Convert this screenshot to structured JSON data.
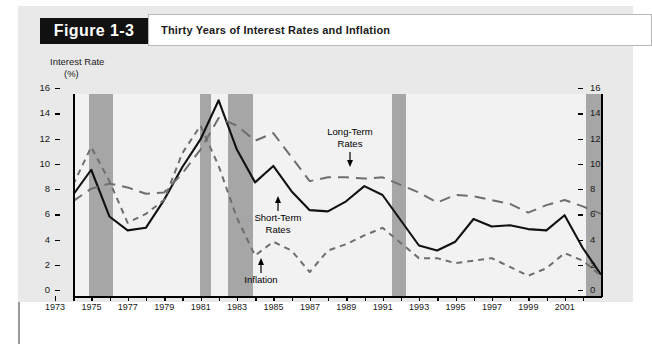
{
  "figure": {
    "badge": "Figure 1-3",
    "title": "Thirty Years of Interest Rates and Inflation"
  },
  "axis": {
    "y_title_line1": "Interest Rate",
    "y_title_line2": "(%)"
  },
  "annotations": {
    "long_term_line1": "Long-Term",
    "long_term_line2": "Rates",
    "short_term_line1": "Short-Term",
    "short_term_line2": "Rates",
    "inflation": "Inflation"
  },
  "colors": {
    "page_background": "#ffffff",
    "figure_background": "#e9e9e9",
    "plot_background": "#f2f2f2",
    "recession_band": "#a6a6a6",
    "badge_background": "#111111",
    "badge_text": "#ffffff",
    "short_term_line": "#111111",
    "long_term_line": "#6e6e6e",
    "inflation_line": "#6e6e6e",
    "axis": "#000000"
  },
  "chart_data": {
    "type": "line",
    "title": "Thirty Years of Interest Rates and Inflation",
    "xlabel": "",
    "ylabel": "Interest Rate (%)",
    "ylim": [
      0,
      16
    ],
    "ytick_step": 2,
    "yticks": [
      0,
      2,
      4,
      6,
      8,
      10,
      12,
      14,
      16
    ],
    "yticks_right": [
      0,
      2,
      4,
      6,
      8,
      10,
      12,
      14,
      16
    ],
    "dual_y_axis": true,
    "grid": false,
    "legend": "inline-annotations",
    "xlim": [
      1973,
      2002
    ],
    "x": [
      1973,
      1974,
      1975,
      1976,
      1977,
      1978,
      1979,
      1980,
      1981,
      1982,
      1983,
      1984,
      1985,
      1986,
      1987,
      1988,
      1989,
      1990,
      1991,
      1992,
      1993,
      1994,
      1995,
      1996,
      1997,
      1998,
      1999,
      2000,
      2001,
      2002
    ],
    "xtick_labels": [
      "1973",
      "1975",
      "1977",
      "1979",
      "1981",
      "1983",
      "1985",
      "1987",
      "1989",
      "1991",
      "1993",
      "1995",
      "1997",
      "1999",
      "2001"
    ],
    "xtick_values": [
      1973,
      1975,
      1977,
      1979,
      1981,
      1983,
      1985,
      1987,
      1989,
      1991,
      1993,
      1995,
      1997,
      1999,
      2001
    ],
    "series": [
      {
        "name": "Short-Term Rates",
        "style": "solid",
        "color": "#111111",
        "values": [
          8.0,
          10.0,
          6.3,
          5.2,
          5.4,
          7.6,
          10.2,
          12.4,
          15.5,
          11.6,
          9.0,
          10.3,
          8.3,
          6.8,
          6.7,
          7.5,
          8.7,
          8.0,
          6.0,
          4.0,
          3.6,
          4.3,
          6.1,
          5.5,
          5.6,
          5.3,
          5.2,
          6.4,
          3.8,
          1.7
        ]
      },
      {
        "name": "Long-Term Rates",
        "style": "long-dash",
        "color": "#6e6e6e",
        "values": [
          7.5,
          8.5,
          8.9,
          8.6,
          8.1,
          8.2,
          9.7,
          11.6,
          14.1,
          13.5,
          12.3,
          12.9,
          11.0,
          9.1,
          9.4,
          9.4,
          9.3,
          9.4,
          8.8,
          8.2,
          7.4,
          8.0,
          7.9,
          7.6,
          7.3,
          6.6,
          7.2,
          7.6,
          7.1,
          6.5
        ]
      },
      {
        "name": "Inflation",
        "style": "short-dash",
        "color": "#6e6e6e",
        "values": [
          8.8,
          11.8,
          9.1,
          5.8,
          6.5,
          7.6,
          11.3,
          13.5,
          10.3,
          6.2,
          3.2,
          4.3,
          3.6,
          1.9,
          3.6,
          4.1,
          4.8,
          5.4,
          4.2,
          3.0,
          3.0,
          2.6,
          2.8,
          3.0,
          2.3,
          1.6,
          2.2,
          3.4,
          2.8,
          1.6
        ]
      }
    ],
    "recession_bands": [
      {
        "start": 1973.9,
        "end": 1975.2
      },
      {
        "start": 1980.0,
        "end": 1980.6
      },
      {
        "start": 1981.5,
        "end": 1982.9
      },
      {
        "start": 1990.5,
        "end": 1991.3
      },
      {
        "start": 2001.2,
        "end": 2002.0
      }
    ]
  }
}
